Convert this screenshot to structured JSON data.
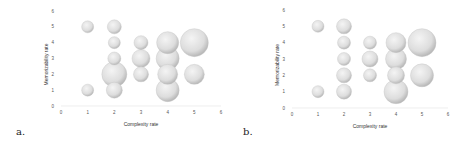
{
  "chart_data": [
    {
      "type": "scatter",
      "subtype": "bubble",
      "panel_label": "a.",
      "title": "",
      "xlabel": "Complexity rate",
      "ylabel": "Memorizability rate",
      "xlim": [
        0,
        6
      ],
      "ylim": [
        0,
        6
      ],
      "x_ticks": [
        "0",
        "1",
        "2",
        "3",
        "4",
        "5",
        "6"
      ],
      "y_ticks": [
        "0",
        "1",
        "2",
        "3",
        "4",
        "5",
        "6"
      ],
      "grid": false,
      "legend": null,
      "points": [
        {
          "x": 1,
          "y": 5,
          "size": 6
        },
        {
          "x": 1,
          "y": 1,
          "size": 6
        },
        {
          "x": 2,
          "y": 5,
          "size": 7
        },
        {
          "x": 2,
          "y": 4,
          "size": 6
        },
        {
          "x": 2,
          "y": 3,
          "size": 6.5
        },
        {
          "x": 2,
          "y": 2,
          "size": 12.5
        },
        {
          "x": 2,
          "y": 1,
          "size": 8
        },
        {
          "x": 3,
          "y": 4,
          "size": 7
        },
        {
          "x": 3,
          "y": 3,
          "size": 9
        },
        {
          "x": 3,
          "y": 2,
          "size": 7.5
        },
        {
          "x": 4,
          "y": 4,
          "size": 11
        },
        {
          "x": 4,
          "y": 3,
          "size": 11.5
        },
        {
          "x": 4,
          "y": 2,
          "size": 10
        },
        {
          "x": 4,
          "y": 1,
          "size": 11.5
        },
        {
          "x": 5,
          "y": 4,
          "size": 14
        },
        {
          "x": 5,
          "y": 2,
          "size": 10
        }
      ]
    },
    {
      "type": "scatter",
      "subtype": "bubble",
      "panel_label": "b.",
      "title": "",
      "xlabel": "Complexity rate",
      "ylabel": "Memorizability rate",
      "xlim": [
        0,
        6
      ],
      "ylim": [
        0,
        6
      ],
      "x_ticks": [
        "0",
        "1",
        "2",
        "3",
        "4",
        "5",
        "6"
      ],
      "y_ticks": [
        "0",
        "1",
        "2",
        "3",
        "4",
        "5",
        "6"
      ],
      "grid": false,
      "legend": null,
      "points": [
        {
          "x": 1,
          "y": 5,
          "size": 6
        },
        {
          "x": 1,
          "y": 1,
          "size": 6
        },
        {
          "x": 2,
          "y": 5,
          "size": 7.5
        },
        {
          "x": 2,
          "y": 4,
          "size": 6.5
        },
        {
          "x": 2,
          "y": 3,
          "size": 6.5
        },
        {
          "x": 2,
          "y": 2,
          "size": 7.5
        },
        {
          "x": 2,
          "y": 1,
          "size": 7.5
        },
        {
          "x": 3,
          "y": 4,
          "size": 6.5
        },
        {
          "x": 3,
          "y": 3,
          "size": 8
        },
        {
          "x": 3,
          "y": 2,
          "size": 6.5
        },
        {
          "x": 4,
          "y": 4,
          "size": 10
        },
        {
          "x": 4,
          "y": 3,
          "size": 10.5
        },
        {
          "x": 4,
          "y": 2,
          "size": 8.5
        },
        {
          "x": 4,
          "y": 1,
          "size": 12
        },
        {
          "x": 5,
          "y": 4,
          "size": 14
        },
        {
          "x": 5,
          "y": 2,
          "size": 11.5
        }
      ]
    }
  ],
  "colors": {
    "bubble_center": "#f4f4f4",
    "bubble_edge": "#b8b8b8",
    "axis_line": "#e2e2e2"
  }
}
